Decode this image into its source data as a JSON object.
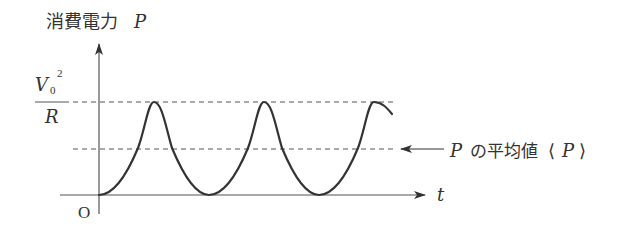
{
  "diagram": {
    "type": "time-series sketch",
    "y_axis": {
      "label_jp": "消費電力",
      "label_var": "P"
    },
    "x_axis": {
      "label": "t",
      "origin_label": "O"
    },
    "max_level": {
      "numerator_var": "V",
      "numerator_sub": "0",
      "numerator_sup": "2",
      "denominator": "R"
    },
    "average_annotation": {
      "var": "P",
      "text_jp": "の平均値",
      "bracket_left": "⟨",
      "bracket_var": "P",
      "bracket_right": "⟩"
    },
    "curve": {
      "shape": "sin-squared (raised cosine)",
      "start": "trough at origin",
      "period_px": 110,
      "peaks": 3,
      "troughs_after_origin": 2
    },
    "colors": {
      "line": "#333333",
      "axis": "#555555",
      "dashed": "#555555",
      "text": "#333333"
    }
  }
}
